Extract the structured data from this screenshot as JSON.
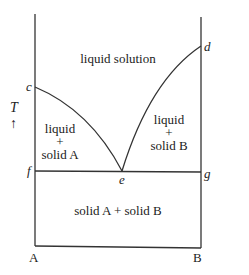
{
  "diagram": {
    "type": "binary eutectic phase diagram",
    "axis": {
      "temperature_label": "T",
      "temperature_arrow": "↑",
      "left_component": "A",
      "right_component": "B"
    },
    "points": {
      "c": "c",
      "d": "d",
      "e": "e",
      "f": "f",
      "g": "g"
    },
    "regions": {
      "liquid_solution": "liquid solution",
      "liquid_solid_a": {
        "line1": "liquid",
        "line2": "+",
        "line3": "solid A"
      },
      "liquid_solid_b": {
        "line1": "liquid",
        "line2": "+",
        "line3": "solid B"
      },
      "solid_ab": "solid A + solid B"
    },
    "colors": {
      "line": "#333333",
      "text": "#222222",
      "background": "#ffffff"
    }
  }
}
